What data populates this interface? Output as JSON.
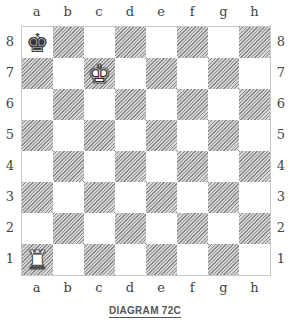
{
  "diagram": {
    "caption": "DIAGRAM 72C",
    "files": [
      "a",
      "b",
      "c",
      "d",
      "e",
      "f",
      "g",
      "h"
    ],
    "ranks": [
      "8",
      "7",
      "6",
      "5",
      "4",
      "3",
      "2",
      "1"
    ],
    "pieces": [
      {
        "square": "a8",
        "type": "king",
        "color": "black",
        "glyph": "♚"
      },
      {
        "square": "c7",
        "type": "king",
        "color": "white",
        "glyph": "♚"
      },
      {
        "square": "a1",
        "type": "rook",
        "color": "white",
        "glyph": "♜"
      }
    ],
    "square_colors": {
      "light": "#ffffff",
      "dark": "hatched-gray"
    }
  }
}
